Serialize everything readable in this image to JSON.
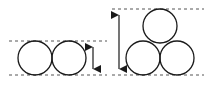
{
  "diagram": {
    "title": "",
    "colors": {
      "stroke": "#1a1a1a",
      "dash": "#555555",
      "background": "#ffffff"
    },
    "left_group": {
      "label": "single row of two circles",
      "dash_top_y": 41,
      "dash_bottom_y": 75,
      "dash_x1": 9,
      "dash_x2": 107,
      "radius": 17,
      "circles": [
        {
          "cx": 35,
          "cy": 58
        },
        {
          "cx": 69,
          "cy": 58
        }
      ],
      "arrow": {
        "x": 93,
        "y1": 41,
        "y2": 75
      }
    },
    "right_group": {
      "label": "triangular stack of three circles",
      "dash_top_y": 9,
      "dash_bottom_y": 75,
      "dash_x1": 112,
      "dash_x2": 204,
      "radius": 17,
      "circles": [
        {
          "cx": 160,
          "cy": 26
        },
        {
          "cx": 143,
          "cy": 58
        },
        {
          "cx": 177,
          "cy": 58
        }
      ],
      "arrow": {
        "x": 119,
        "y1": 9,
        "y2": 75
      }
    }
  }
}
